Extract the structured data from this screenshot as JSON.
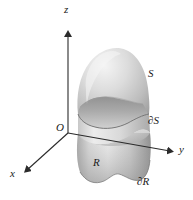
{
  "figure": {
    "background_color": "#ffffff",
    "ink_color": "#1a1a1a",
    "width": 193,
    "height": 200
  },
  "axes": {
    "origin_label": "O",
    "z_label": "z",
    "y_label": "y",
    "x_label": "x",
    "origin_point": [
      68,
      133
    ],
    "z_tip": [
      68,
      30
    ],
    "y_tip": [
      176,
      152
    ],
    "x_tip": [
      22,
      174
    ],
    "line_color": "#2b2b2b"
  },
  "labels": {
    "surface": "S",
    "surface_boundary": "∂S",
    "region": "R",
    "region_boundary": "∂R"
  },
  "label_positions": {
    "surface": [
      149,
      73
    ],
    "surface_boundary": [
      150,
      120
    ],
    "region": [
      94,
      161
    ],
    "region_boundary": [
      139,
      179
    ],
    "origin": [
      58,
      126
    ],
    "z": [
      67,
      8
    ],
    "y": [
      179,
      148
    ],
    "x": [
      11,
      171
    ]
  },
  "colors": {
    "dome_light": "#efefef",
    "dome_mid": "#c9c9c9",
    "dome_dark": "#9a9a9a",
    "inner_surface_light": "#d8d8d8",
    "inner_surface_dark": "#8e8e8e",
    "cylinder_light": "#e6e6e6",
    "cylinder_mid": "#c2c2c2",
    "cylinder_dark": "#8a8a8a",
    "region_fill": "#cfcfcf",
    "outline": "#6f6f6f"
  },
  "geometry_notes": {
    "surface_description": "Smooth dome-shaped cap surface S rising above the xy-plane",
    "surface_boundary_description": "Wavy closed curve ∂S where the cap meets the cylindrical wall",
    "region_description": "Planar region R in the xy-plane, the projection of S",
    "region_boundary_description": "Wavy closed curve ∂R bounding the planar region R"
  }
}
